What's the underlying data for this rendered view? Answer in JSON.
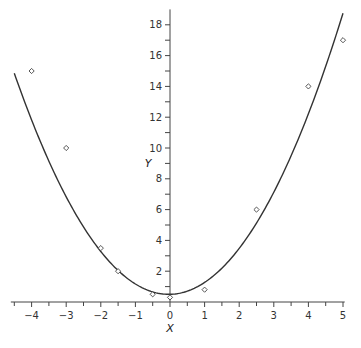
{
  "chart_data": {
    "type": "scatter",
    "title": "",
    "xlabel": "X",
    "ylabel": "Y",
    "xlim": [
      -4.5,
      5
    ],
    "ylim": [
      0,
      19
    ],
    "grid": false,
    "legend": null,
    "x_ticks": [
      -4,
      -3,
      -2,
      -1,
      0,
      1,
      2,
      3,
      4,
      5
    ],
    "x_tick_labels": [
      "−4",
      "−3",
      "−2",
      "−1",
      "0",
      "1",
      "2",
      "3",
      "4",
      "5"
    ],
    "y_ticks": [
      2,
      4,
      6,
      8,
      10,
      12,
      14,
      16,
      18
    ],
    "y_tick_labels": [
      "2",
      "4",
      "6",
      "8",
      "10",
      "12",
      "14",
      "16",
      "18"
    ],
    "series": [
      {
        "name": "observed",
        "marker": "diamond",
        "points": [
          {
            "x": -4,
            "y": 15
          },
          {
            "x": -3,
            "y": 10
          },
          {
            "x": -2,
            "y": 3.5
          },
          {
            "x": -1.5,
            "y": 2
          },
          {
            "x": -0.5,
            "y": 0.5
          },
          {
            "x": 0,
            "y": 0.3
          },
          {
            "x": 1,
            "y": 0.8
          },
          {
            "x": 2.5,
            "y": 6
          },
          {
            "x": 4,
            "y": 14
          },
          {
            "x": 5,
            "y": 17
          }
        ]
      },
      {
        "name": "fitted curve",
        "type": "line",
        "form": "quadratic",
        "coefficients": {
          "a": 0.72,
          "b": 0.05,
          "c": 0.5
        },
        "x_range": [
          -4.5,
          5
        ]
      }
    ]
  }
}
